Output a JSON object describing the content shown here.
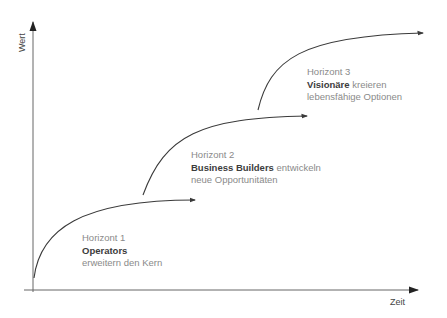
{
  "axes": {
    "y_label": "Wert",
    "x_label": "Zeit"
  },
  "horizons": [
    {
      "title": "Horizont 1",
      "name": "Operators",
      "description_inline": "",
      "description": "erweitern den Kern"
    },
    {
      "title": "Horizont 2",
      "name": "Business Builders",
      "description_inline": " entwickeln",
      "description": "neue Opportunitäten"
    },
    {
      "title": "Horizont 3",
      "name": "Visionäre",
      "description_inline": " kreieren",
      "description": "lebensfähige Optionen"
    }
  ],
  "colors": {
    "curve": "#3a3a3a",
    "axis": "#555555",
    "title_text": "#8a8a8a",
    "name_text": "#3c3c3c"
  }
}
